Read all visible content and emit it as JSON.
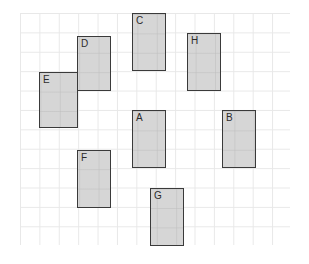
{
  "diagram": {
    "background_color": "#ffffff",
    "grid": {
      "line_color": "#e8e8e8",
      "cell_size": 19.4,
      "origin_x": 20,
      "origin_y": 13,
      "width": 270,
      "height": 232,
      "columns": 14,
      "rows": 12
    },
    "rect_style": {
      "fill_color": "#d6d6d6",
      "border_color": "#3a3a3a",
      "label_color": "#2b2b2b"
    },
    "rectangles": [
      {
        "label": "A",
        "x": 132,
        "y": 110,
        "w": 34,
        "h": 58
      },
      {
        "label": "B",
        "x": 222,
        "y": 110,
        "w": 34,
        "h": 58
      },
      {
        "label": "C",
        "x": 132,
        "y": 13,
        "w": 34,
        "h": 58
      },
      {
        "label": "D",
        "x": 77,
        "y": 36,
        "w": 34,
        "h": 55
      },
      {
        "label": "E",
        "x": 39,
        "y": 72,
        "w": 39,
        "h": 56
      },
      {
        "label": "F",
        "x": 77,
        "y": 150,
        "w": 34,
        "h": 58
      },
      {
        "label": "G",
        "x": 150,
        "y": 188,
        "w": 34,
        "h": 58
      },
      {
        "label": "H",
        "x": 187,
        "y": 33,
        "w": 34,
        "h": 58
      }
    ]
  }
}
